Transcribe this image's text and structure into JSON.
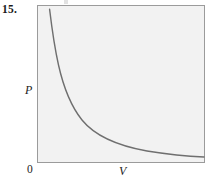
{
  "figure": {
    "problem_number": "15.",
    "origin_label": "0",
    "y_axis_label": "P",
    "x_axis_label": "V",
    "frame_fill": "#f2f2f2",
    "frame_border_color": "#9b9b9b",
    "curve_color": "#6f6f6f"
  },
  "chart_data": {
    "type": "line",
    "title": "",
    "xlabel": "V",
    "ylabel": "P",
    "grid": false,
    "legend": null,
    "annotations": [
      "0"
    ],
    "xlim": [
      0,
      10
    ],
    "ylim": [
      0,
      10
    ],
    "series": [
      {
        "name": "P = k/V",
        "x": [
          0.75,
          0.85,
          1.0,
          1.2,
          1.5,
          1.8,
          2.2,
          2.7,
          3.3,
          4.0,
          5.0,
          6.2,
          7.5,
          9.0,
          10.0
        ],
        "y": [
          9.45,
          8.2,
          7.0,
          5.85,
          4.7,
          3.95,
          3.25,
          2.65,
          2.2,
          1.85,
          1.5,
          1.25,
          1.08,
          0.95,
          0.9
        ]
      }
    ],
    "pixel_path": "M 12.6,4.3 C 14.5,20 17.5,42 21.5,60 C 26,80 33,100 45,115 C 58,131 82,141 110,146 C 135,150 155,151.5 167,152"
  }
}
